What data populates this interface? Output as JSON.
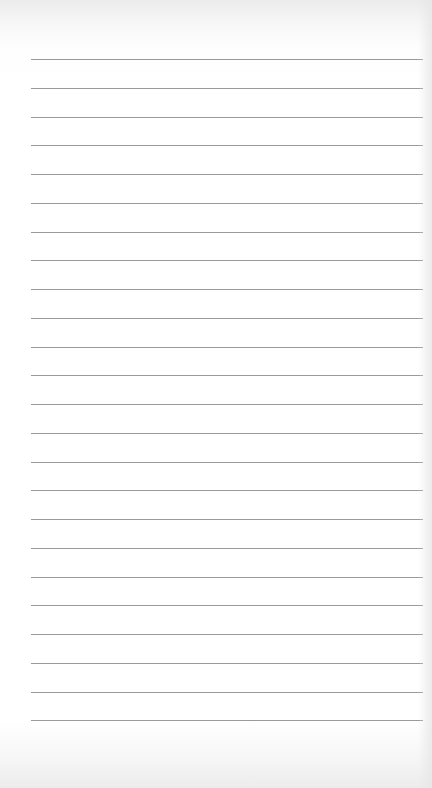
{
  "page": {
    "type": "lined-paper",
    "background_color": "#ffffff",
    "rule_color": "#8f8f8f",
    "rule_count": 24,
    "rule_start_y": 59,
    "rule_spacing": 28.75,
    "rule_left_x": 31,
    "rule_right_x": 423,
    "content": ""
  }
}
